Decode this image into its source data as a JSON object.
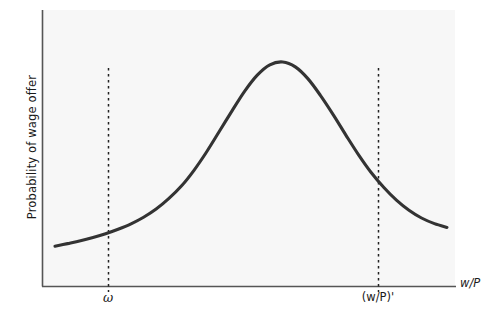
{
  "chart_data": {
    "type": "line",
    "title": "",
    "subtitle": "",
    "xlabel": "w/P",
    "ylabel": "Probability of wage offer",
    "grid": false,
    "legend": null,
    "xlim": [
      0,
      100
    ],
    "ylim": [
      0,
      100
    ],
    "axis_tick_labels": {
      "x": [
        "ω",
        "(w/P)'"
      ],
      "y": []
    },
    "annotations": [
      {
        "name": "reservation-wage-line",
        "label": "ω",
        "type": "vertical-dashed-line",
        "x": 16.0
      },
      {
        "name": "market-wage-line",
        "label": "(w/P)'",
        "type": "vertical-dashed-line",
        "x": 81.4
      }
    ],
    "series": [
      {
        "name": "Probability of wage offer distribution",
        "color": "#333333",
        "x": [
          0.0,
          3.2,
          6.5,
          9.7,
          12.9,
          16.1,
          19.4,
          22.6,
          25.8,
          29.0,
          32.3,
          35.5,
          38.7,
          41.9,
          45.2,
          48.4,
          51.6,
          54.8,
          58.1,
          61.3,
          64.5,
          67.7,
          71.0,
          74.2,
          77.4,
          80.6,
          83.9,
          87.1,
          90.3,
          93.5,
          96.8,
          100.0
        ],
        "y": [
          8.0,
          9.1,
          10.3,
          11.7,
          13.3,
          15.2,
          17.5,
          20.3,
          23.8,
          28.2,
          33.7,
          40.4,
          48.2,
          56.8,
          65.7,
          74.0,
          80.8,
          85.2,
          86.4,
          84.3,
          79.3,
          72.2,
          63.9,
          55.3,
          47.0,
          39.5,
          33.0,
          27.6,
          23.3,
          20.0,
          17.6,
          16.0
        ]
      }
    ]
  },
  "axes": {
    "x_axis_name": "horizontal-axis",
    "y_axis_name": "vertical-axis"
  },
  "style": {
    "curve_color": "#333333",
    "axis_color": "#555555",
    "plot_background": "#f7f7f7",
    "page_background": "#ffffff",
    "dashed_line_color": "#222222",
    "text_color": "#1a1a1a"
  }
}
